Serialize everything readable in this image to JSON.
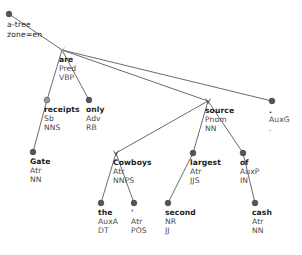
{
  "diagram": {
    "type": "dependency-tree",
    "kind": "tectogrammatical-analytical tree",
    "root": {
      "name": "a-tree",
      "zone_line": "zone=en",
      "x": 9,
      "y": 14,
      "marker": "dark-circle"
    },
    "colors": {
      "edge": "#5a5a5a",
      "node_dark": "#555555",
      "node_grey": "#9a9a9a",
      "form_text": "#1c1c1c",
      "meta_text": "#4a4a4a",
      "background": "#ffffff"
    },
    "nodes": [
      {
        "id": "are",
        "form": "are",
        "afun": "Pred",
        "pos": "VBP",
        "x": 62,
        "y": 50,
        "marker": "grey-arrow",
        "parent": "root"
      },
      {
        "id": "receipts",
        "form": "receipts",
        "afun": "Sb",
        "pos": "NNS",
        "x": 47,
        "y": 100,
        "marker": "grey-circle",
        "parent": "are"
      },
      {
        "id": "only",
        "form": "only",
        "afun": "Adv",
        "pos": "RB",
        "x": 89,
        "y": 100,
        "marker": "dark-circle",
        "parent": "are"
      },
      {
        "id": "source",
        "form": "source",
        "afun": "Pnom",
        "pos": "NN",
        "x": 208,
        "y": 101,
        "marker": "dark-arrow",
        "parent": "are"
      },
      {
        "id": "auxg",
        "form": ".",
        "afun": "AuxG",
        "pos": ".",
        "x": 272,
        "y": 101,
        "marker": "dark-circle",
        "parent": "are"
      },
      {
        "id": "gate",
        "form": "Gate",
        "afun": "Atr",
        "pos": "NN",
        "x": 33,
        "y": 152,
        "marker": "dark-circle",
        "parent": "receipts"
      },
      {
        "id": "cowboys",
        "form": "Cowboys",
        "afun": "Atr",
        "pos": "NNPS",
        "x": 116,
        "y": 153,
        "marker": "dark-arrow",
        "parent": "source"
      },
      {
        "id": "largest",
        "form": "largest",
        "afun": "Atr",
        "pos": "JJS",
        "x": 193,
        "y": 153,
        "marker": "dark-circle",
        "parent": "source"
      },
      {
        "id": "of",
        "form": "of",
        "afun": "AuxP",
        "pos": "IN",
        "x": 243,
        "y": 153,
        "marker": "dark-circle",
        "parent": "source"
      },
      {
        "id": "the",
        "form": "the",
        "afun": "AuxA",
        "pos": "DT",
        "x": 101,
        "y": 203,
        "marker": "dark-circle",
        "parent": "cowboys"
      },
      {
        "id": "apos",
        "form": "'",
        "afun": "Atr",
        "pos": "POS",
        "x": 134,
        "y": 203,
        "marker": "dark-circle",
        "parent": "cowboys"
      },
      {
        "id": "second",
        "form": "second",
        "afun": "NR",
        "pos": "JJ",
        "x": 168,
        "y": 203,
        "marker": "dark-circle",
        "parent": "largest"
      },
      {
        "id": "cash",
        "form": "cash",
        "afun": "Atr",
        "pos": "NN",
        "x": 255,
        "y": 203,
        "marker": "dark-circle",
        "parent": "of"
      }
    ],
    "edges": [
      {
        "from": "root",
        "to": "are"
      },
      {
        "from": "are",
        "to": "receipts"
      },
      {
        "from": "are",
        "to": "only"
      },
      {
        "from": "are",
        "to": "source"
      },
      {
        "from": "are",
        "to": "auxg"
      },
      {
        "from": "receipts",
        "to": "gate"
      },
      {
        "from": "source",
        "to": "cowboys"
      },
      {
        "from": "source",
        "to": "largest"
      },
      {
        "from": "source",
        "to": "of"
      },
      {
        "from": "cowboys",
        "to": "the"
      },
      {
        "from": "cowboys",
        "to": "apos"
      },
      {
        "from": "largest",
        "to": "second"
      },
      {
        "from": "of",
        "to": "cash"
      }
    ]
  }
}
